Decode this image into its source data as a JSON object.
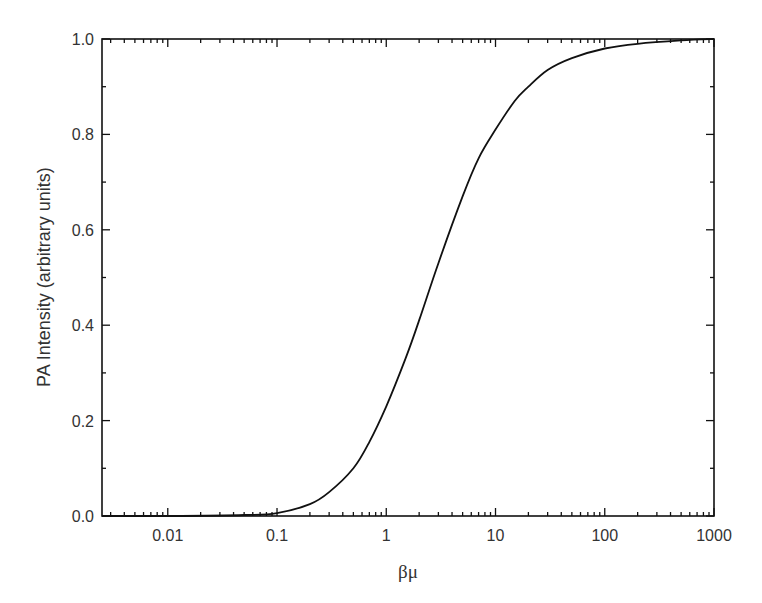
{
  "chart_data": {
    "type": "line",
    "title": "",
    "xlabel": "βμ",
    "ylabel": "PA Intensity (arbitrary units)",
    "xscale": "log",
    "xlim": [
      0.0025,
      1000
    ],
    "ylim": [
      0.0,
      1.0
    ],
    "x_ticks": [
      0.01,
      0.1,
      1,
      10,
      100,
      1000
    ],
    "x_tick_labels": [
      "0.01",
      "0.1",
      "1",
      "10",
      "100",
      "1000"
    ],
    "y_ticks": [
      0.0,
      0.2,
      0.4,
      0.6,
      0.8,
      1.0
    ],
    "y_tick_labels": [
      "0.0",
      "0.2",
      "0.4",
      "0.6",
      "0.8",
      "1.0"
    ],
    "grid": false,
    "legend": null,
    "series": [
      {
        "name": "PA Intensity",
        "color": "#111111",
        "x": [
          0.0025,
          0.01,
          0.05,
          0.1,
          0.2,
          0.3,
          0.5,
          0.7,
          1,
          1.5,
          2,
          3,
          5,
          7,
          10,
          15,
          20,
          30,
          50,
          100,
          200,
          500,
          1000
        ],
        "y": [
          0.0,
          0.0,
          0.002,
          0.006,
          0.025,
          0.05,
          0.1,
          0.155,
          0.23,
          0.33,
          0.41,
          0.53,
          0.67,
          0.75,
          0.81,
          0.87,
          0.9,
          0.935,
          0.96,
          0.98,
          0.99,
          0.997,
          1.0
        ]
      }
    ]
  }
}
